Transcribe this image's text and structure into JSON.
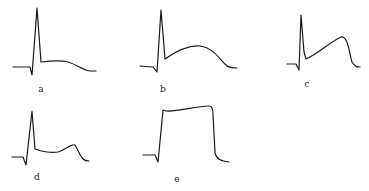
{
  "figure": {
    "panels": [
      {
        "id": "a",
        "label": "a",
        "shape": "spike then low flat plateau, gentle descent to baseline",
        "path": "M13,67 L30,67 L32,75 L37,8 L41,62 C50,61 60,60 68,62 C78,65 82,70 90,71 L96,71",
        "label_pos": [
          41,
          89
        ]
      },
      {
        "id": "b",
        "label": "b",
        "shape": "spike then broad dome-shaped elevation",
        "path": "M140,66 L153,67 L157,72 L161,10 L165,59 C175,52 188,45 200,46 C214,48 220,60 226,65 C229,68 233,68 237,68",
        "label_pos": [
          163,
          89
        ]
      },
      {
        "id": "c",
        "label": "c",
        "shape": "spike then rising ramp to late peak, sharp fall",
        "path": "M287,64 L296,64 L299,70 L301,15 L304,52 L306,59 C318,54 330,42 341,37 C348,36 349,52 352,62 C355,67 357,67 360,67",
        "label_pos": [
          307,
          83
        ]
      },
      {
        "id": "d",
        "label": "d",
        "shape": "spike then flat segment with small late hump",
        "path": "M12,157 L23,157 L26,165 L32,111 L35,149 C42,152 52,153 58,152 C66,150 71,143 75,145 C78,150 80,156 83,159 C85,161 87,161 89,161",
        "label_pos": [
          37,
          177
        ]
      },
      {
        "id": "e",
        "label": "e",
        "shape": "monophasic tombstone-like elevation",
        "path": "M143,155 L155,155 L158,162 L163,110 L166,111 C178,112 195,106 209,106 C212,106 213,110 213,114 L215,153 C217,160 222,161 229,162",
        "label_pos": [
          177,
          180
        ]
      }
    ]
  }
}
